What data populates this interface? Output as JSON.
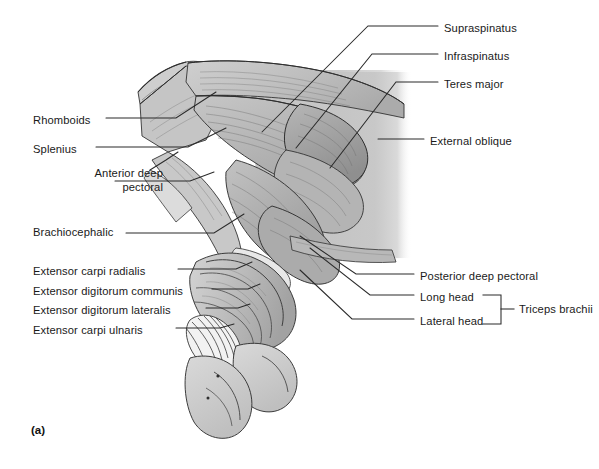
{
  "figure": {
    "panel_letter": "(a)",
    "view": "lateral",
    "style": "grayscale line drawing with shaded muscle bellies and striation hatching",
    "canvas": {
      "width": 599,
      "height": 469,
      "background": "#ffffff"
    }
  },
  "colors": {
    "background": "#ffffff",
    "ink": "#1a1a1a",
    "leader_line": "#2a2a2a",
    "muscle_light": "#d8d8d8",
    "muscle_mid": "#bdbdbd",
    "muscle_dark": "#9a9a9a",
    "muscle_darker": "#7e7e7e",
    "body_backdrop": "#c9c9c9",
    "highlight": "#f0f0f0",
    "hoof": "#cccccc",
    "outline": "#333333"
  },
  "labels_left": [
    {
      "id": "rhomboids",
      "text": "Rhomboids",
      "text_x": 33,
      "text_y": 121,
      "lines": 1
    },
    {
      "id": "splenius",
      "text": "Splenius",
      "text_x": 33,
      "text_y": 150,
      "lines": 1
    },
    {
      "id": "anterior-deep-pectoral",
      "text": "Anterior deep\npectoral",
      "text_line1": "Anterior deep",
      "text_line2": "pectoral",
      "text_x": 33,
      "text_y": 173,
      "lines": 2
    },
    {
      "id": "brachiocephalic",
      "text": "Brachiocephalic",
      "text_x": 33,
      "text_y": 233,
      "lines": 1
    },
    {
      "id": "extensor-carpi-radialis",
      "text": "Extensor carpi radialis",
      "text_x": 33,
      "text_y": 272,
      "lines": 1
    },
    {
      "id": "extensor-digitorum-communis",
      "text": "Extensor digitorum communis",
      "text_x": 33,
      "text_y": 292,
      "lines": 1
    },
    {
      "id": "extensor-digitorum-lateralis",
      "text": "Extensor digitorum lateralis",
      "text_x": 33,
      "text_y": 311,
      "lines": 1
    },
    {
      "id": "extensor-carpi-ulnaris",
      "text": "Extensor carpi ulnaris",
      "text_x": 33,
      "text_y": 331,
      "lines": 1
    }
  ],
  "labels_right": [
    {
      "id": "supraspinatus",
      "text": "Supraspinatus",
      "text_x": 444,
      "text_y": 29
    },
    {
      "id": "infraspinatus",
      "text": "Infraspinatus",
      "text_x": 444,
      "text_y": 57
    },
    {
      "id": "teres-major",
      "text": "Teres major",
      "text_x": 444,
      "text_y": 85
    },
    {
      "id": "external-oblique",
      "text": "External oblique",
      "text_x": 430,
      "text_y": 142
    },
    {
      "id": "posterior-deep-pectoral",
      "text": "Posterior deep pectoral",
      "text_x": 420,
      "text_y": 277
    },
    {
      "id": "long-head",
      "text": "Long head",
      "text_x": 420,
      "text_y": 298
    },
    {
      "id": "lateral-head",
      "text": "Lateral head",
      "text_x": 420,
      "text_y": 322
    }
  ],
  "bracket_group": {
    "id": "triceps-brachii",
    "text": "Triceps brachii",
    "text_x": 519,
    "text_y": 310,
    "members": [
      "Long head",
      "Lateral head"
    ],
    "bracket_x": 501,
    "bracket_top_y": 294,
    "bracket_bottom_y": 324,
    "tick_x_end": 514
  }
}
